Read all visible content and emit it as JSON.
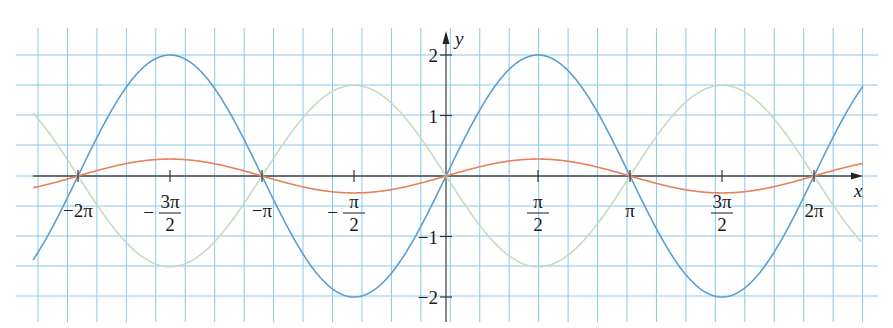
{
  "chart_data": {
    "type": "line",
    "title": "",
    "xlabel": "x",
    "ylabel": "y",
    "xlim_units_of_pi": [
      -2.245,
      2.25
    ],
    "ylim": [
      -2.3,
      2.3
    ],
    "grid": true,
    "legend": null,
    "x_ticks": [
      {
        "value_pi": -2,
        "label": "−2π"
      },
      {
        "value_pi": -1.5,
        "label_sign": "−",
        "label_num": "3π",
        "label_den": "2"
      },
      {
        "value_pi": -1,
        "label": "−π"
      },
      {
        "value_pi": -0.5,
        "label_sign": "−",
        "label_num": "π",
        "label_den": "2"
      },
      {
        "value_pi": 0.5,
        "label_sign": "",
        "label_num": "π",
        "label_den": "2"
      },
      {
        "value_pi": 1,
        "label": "π"
      },
      {
        "value_pi": 1.5,
        "label_sign": "",
        "label_num": "3π",
        "label_den": "2"
      },
      {
        "value_pi": 2,
        "label": "2π"
      }
    ],
    "y_ticks": [
      {
        "value": 2,
        "label": "2"
      },
      {
        "value": 1,
        "label": "1"
      },
      {
        "value": -1,
        "label": "−1"
      },
      {
        "value": -2,
        "label": "−2"
      }
    ],
    "series": [
      {
        "name": "y = 2 sin x",
        "amplitude": 2,
        "color": "#5a9fd4",
        "points": [
          [
            -2.245,
            -1.45
          ],
          [
            -2,
            0
          ],
          [
            -1.5,
            2
          ],
          [
            -1,
            0
          ],
          [
            -0.5,
            -2
          ],
          [
            0,
            0
          ],
          [
            0.5,
            2
          ],
          [
            1,
            0
          ],
          [
            1.5,
            -2
          ],
          [
            2,
            0
          ],
          [
            2.25,
            1.45
          ]
        ]
      },
      {
        "name": "y = -1.5 sin x",
        "amplitude": -1.5,
        "color": "#c5dcc0",
        "points": [
          [
            -2.245,
            1.09
          ],
          [
            -2,
            0
          ],
          [
            -1.5,
            -1.5
          ],
          [
            -1,
            0
          ],
          [
            -0.5,
            1.5
          ],
          [
            0,
            0
          ],
          [
            0.5,
            -1.5
          ],
          [
            1,
            0
          ],
          [
            1.5,
            1.5
          ],
          [
            2,
            0
          ],
          [
            2.25,
            -1.09
          ]
        ]
      },
      {
        "name": "y = 0.28 sin x",
        "amplitude": 0.28,
        "color": "#e8805a",
        "points": [
          [
            -2.245,
            -0.2
          ],
          [
            -2,
            0
          ],
          [
            -1.5,
            0.28
          ],
          [
            -1,
            0
          ],
          [
            -0.5,
            -0.28
          ],
          [
            0,
            0
          ],
          [
            0.5,
            0.28
          ],
          [
            1,
            0
          ],
          [
            1.5,
            -0.28
          ],
          [
            2,
            0
          ],
          [
            2.25,
            0.2
          ]
        ]
      }
    ]
  },
  "colors": {
    "grid": "#8cc8e8",
    "axis": "#4a4a4a",
    "text": "#1a1a1a"
  },
  "layout": {
    "origin_x": 446,
    "origin_y": 176,
    "px_per_pi": 184,
    "px_per_unit_y": 60.5,
    "grid_x_start": 38,
    "grid_x_step": 29.45,
    "grid_x_count": 29,
    "grid_y_lines": [
      55,
      85,
      115,
      145,
      176,
      206,
      236,
      266,
      296
    ],
    "grid_left": 16,
    "grid_right": 878,
    "grid_top": 28,
    "grid_bottom": 322,
    "curve_x_start": 33,
    "curve_x_end": 863
  }
}
